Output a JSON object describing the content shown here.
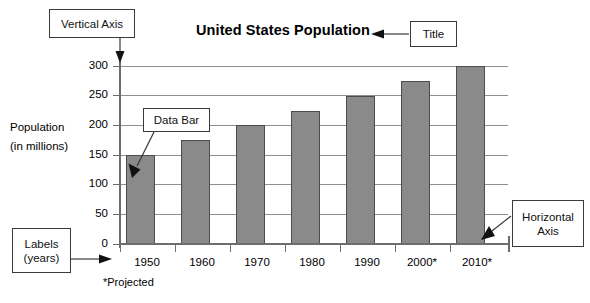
{
  "chart_data": {
    "type": "bar",
    "title": "United States Population",
    "xlabel": "",
    "ylabel": "Population (in millions)",
    "ylabel_line1": "Population",
    "ylabel_line2": "(in millions)",
    "categories": [
      "1950",
      "1960",
      "1970",
      "1980",
      "1990",
      "2000*",
      "2010*"
    ],
    "values": [
      150,
      175,
      200,
      225,
      250,
      275,
      300
    ],
    "ylim": [
      0,
      300
    ],
    "yticks": [
      0,
      50,
      100,
      150,
      200,
      250,
      300
    ],
    "ytick_labels": [
      "0",
      "50",
      "100",
      "150",
      "200",
      "250",
      "300"
    ],
    "grid": true,
    "legend": "none",
    "footnote": "*Projected",
    "bar_color": "#8a8a8a",
    "bar_edge_color": "#4c4c4c",
    "axis_color": "#6d6d6d",
    "grid_color": "#8f8f8f"
  },
  "annotations": {
    "vertical_axis": {
      "label": "Vertical Axis"
    },
    "title_callout": {
      "label": "Title"
    },
    "data_bar": {
      "label": "Data Bar"
    },
    "labels_years": {
      "line1": "Labels",
      "line2": "(years)"
    },
    "horizontal_axis": {
      "line1": "Horizontal",
      "line2": "Axis"
    }
  }
}
